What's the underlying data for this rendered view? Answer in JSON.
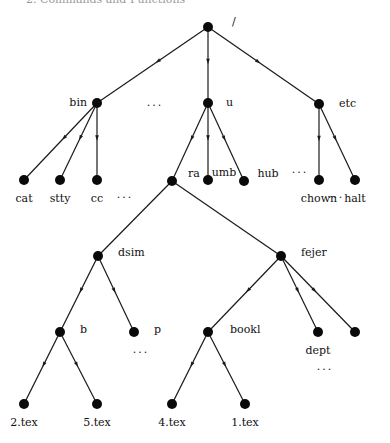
{
  "header": {
    "text": "2. Commands and Functions"
  },
  "tree": {
    "nodes": [
      {
        "id": "root",
        "label": "/"
      },
      {
        "id": "bin",
        "label": "bin"
      },
      {
        "id": "u",
        "label": "u"
      },
      {
        "id": "etc",
        "label": "etc"
      },
      {
        "id": "cat",
        "label": "cat"
      },
      {
        "id": "stty",
        "label": "stty"
      },
      {
        "id": "cc",
        "label": "cc"
      },
      {
        "id": "ra",
        "label": "ra"
      },
      {
        "id": "umb",
        "label": "umb"
      },
      {
        "id": "hub",
        "label": "hub"
      },
      {
        "id": "chown",
        "label": "chown"
      },
      {
        "id": "halt",
        "label": "halt"
      },
      {
        "id": "dsim",
        "label": "dsim"
      },
      {
        "id": "fejer",
        "label": "fejer"
      },
      {
        "id": "b",
        "label": "b"
      },
      {
        "id": "p",
        "label": "p"
      },
      {
        "id": "bookl",
        "label": "bookl"
      },
      {
        "id": "dept",
        "label": "dept"
      },
      {
        "id": "fejer_other",
        "label": ""
      },
      {
        "id": "tex2",
        "label": "2.tex"
      },
      {
        "id": "tex5",
        "label": "5.tex"
      },
      {
        "id": "tex4",
        "label": "4.tex"
      },
      {
        "id": "tex1",
        "label": "1.tex"
      }
    ],
    "edges": [
      {
        "from": "root",
        "to": "bin",
        "arrow": true
      },
      {
        "from": "root",
        "to": "u",
        "arrow": true
      },
      {
        "from": "root",
        "to": "etc",
        "arrow": true
      },
      {
        "from": "bin",
        "to": "cat",
        "arrow": true
      },
      {
        "from": "bin",
        "to": "stty",
        "arrow": true
      },
      {
        "from": "bin",
        "to": "cc",
        "arrow": true
      },
      {
        "from": "u",
        "to": "ra",
        "arrow": true
      },
      {
        "from": "u",
        "to": "umb",
        "arrow": true
      },
      {
        "from": "u",
        "to": "hub",
        "arrow": true
      },
      {
        "from": "etc",
        "to": "chown",
        "arrow": true
      },
      {
        "from": "etc",
        "to": "halt",
        "arrow": true
      },
      {
        "from": "ra",
        "to": "dsim",
        "arrow": false
      },
      {
        "from": "ra",
        "to": "fejer",
        "arrow": false
      },
      {
        "from": "dsim",
        "to": "b",
        "arrow": true
      },
      {
        "from": "dsim",
        "to": "p",
        "arrow": true
      },
      {
        "from": "fejer",
        "to": "bookl",
        "arrow": true
      },
      {
        "from": "fejer",
        "to": "dept",
        "arrow": true
      },
      {
        "from": "fejer",
        "to": "fejer_other",
        "arrow": true
      },
      {
        "from": "b",
        "to": "tex2",
        "arrow": true
      },
      {
        "from": "b",
        "to": "tex5",
        "arrow": true
      },
      {
        "from": "bookl",
        "to": "tex4",
        "arrow": true
      },
      {
        "from": "bookl",
        "to": "tex1",
        "arrow": true
      }
    ],
    "ellipsis": "..."
  }
}
